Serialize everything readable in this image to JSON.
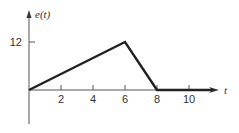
{
  "chart_data": {
    "type": "line",
    "title": "",
    "xlabel": "t",
    "ylabel": "e(t)",
    "xlim": [
      0,
      12
    ],
    "ylim": [
      -5,
      16
    ],
    "x_ticks": [
      2,
      4,
      6,
      8,
      10
    ],
    "x_tick_labels": [
      "2",
      "4",
      "6",
      "8",
      "10"
    ],
    "y_ticks": [
      12
    ],
    "y_tick_labels": [
      "12"
    ],
    "grid": false,
    "legend": "none",
    "series": [
      {
        "name": "e(t)",
        "x": [
          0,
          6,
          8,
          11.5
        ],
        "y": [
          0,
          12,
          0,
          0
        ]
      }
    ]
  }
}
